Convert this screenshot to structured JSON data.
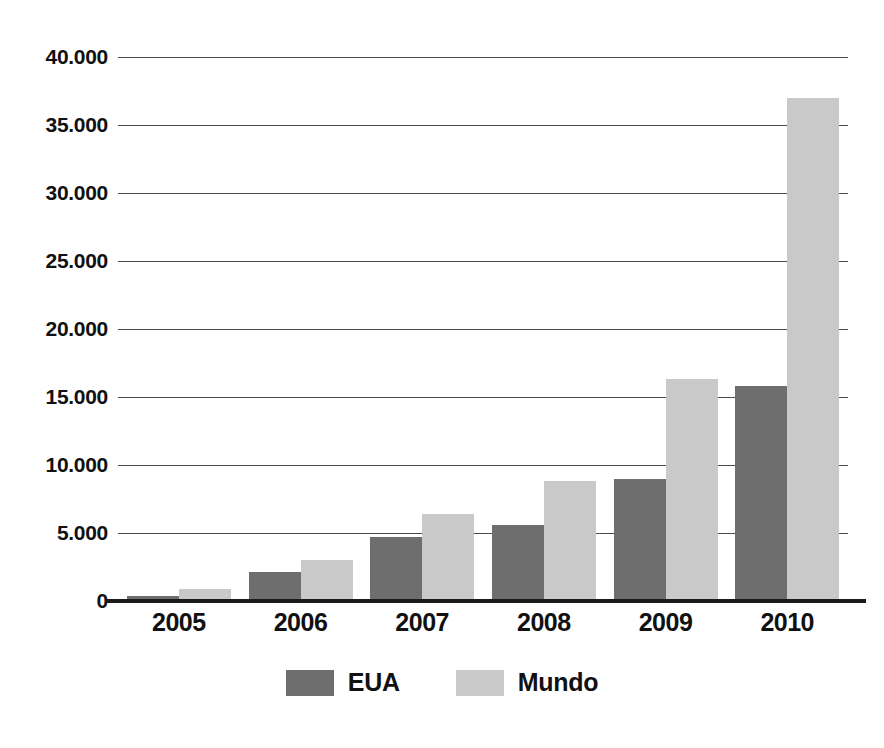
{
  "chart_data": {
    "type": "bar",
    "title": "",
    "subtitle": "",
    "xlabel": "",
    "ylabel": "",
    "categories": [
      "2005",
      "2006",
      "2007",
      "2008",
      "2009",
      "2010"
    ],
    "series": [
      {
        "name": "EUA",
        "color": "#6e6e6e",
        "values": [
          400,
          2100,
          4700,
          5600,
          9000,
          15800
        ]
      },
      {
        "name": "Mundo",
        "color": "#c9c9c9",
        "values": [
          900,
          3000,
          6400,
          8800,
          16300,
          37000
        ]
      }
    ],
    "ylim": [
      0,
      40000
    ],
    "ytick_values": [
      0,
      5000,
      10000,
      15000,
      20000,
      25000,
      30000,
      35000,
      40000
    ],
    "ytick_labels": [
      "0",
      "5.000",
      "10.000",
      "15.000",
      "20.000",
      "25.000",
      "30.000",
      "35.000",
      "40.000"
    ],
    "grid": true,
    "legend_position": "bottom",
    "thousands_separator": "."
  },
  "legend": {
    "items": [
      {
        "label": "EUA",
        "swatch": "dark-gray-swatch"
      },
      {
        "label": "Mundo",
        "swatch": "light-gray-swatch"
      }
    ]
  }
}
